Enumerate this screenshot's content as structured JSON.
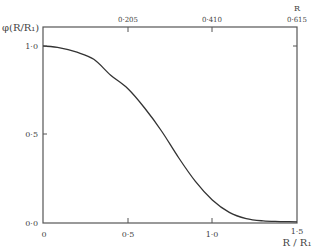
{
  "chart_data": {
    "type": "line",
    "title": "",
    "ylabel": "φ(R/R₁)",
    "xlabel": "R/R₁",
    "top_xlabel": "R",
    "xlim": [
      0,
      1.5
    ],
    "ylim": [
      0,
      1.0
    ],
    "x_ticks": [
      {
        "value": 0,
        "label": "0"
      },
      {
        "value": 0.5,
        "label": "0·5"
      },
      {
        "value": 1.0,
        "label": "1·0"
      },
      {
        "value": 1.5,
        "label": "1·5"
      }
    ],
    "top_x_ticks": [
      {
        "value": 0.5,
        "label": "0·205"
      },
      {
        "value": 1.0,
        "label": "0·410"
      },
      {
        "value": 1.5,
        "label": "0·615"
      }
    ],
    "y_ticks": [
      {
        "value": 0.0,
        "label": "0·0"
      },
      {
        "value": 0.5,
        "label": "0·5"
      },
      {
        "value": 1.0,
        "label": "1·0"
      }
    ],
    "grid": false,
    "legend": null,
    "series": [
      {
        "name": "φ(R/R₁)",
        "x": [
          0,
          0.1,
          0.2,
          0.3,
          0.4,
          0.5,
          0.6,
          0.7,
          0.8,
          0.9,
          1.0,
          1.1,
          1.2,
          1.3,
          1.4,
          1.5
        ],
        "y": [
          1.0,
          0.99,
          0.965,
          0.925,
          0.835,
          0.76,
          0.65,
          0.52,
          0.37,
          0.235,
          0.13,
          0.06,
          0.025,
          0.012,
          0.008,
          0.007
        ]
      }
    ]
  },
  "labels": {
    "y_axis": "φ(R/R₁)",
    "x_axis_bottom": "R / R₁",
    "x_axis_top": "R",
    "y_tick_0": "0·0",
    "y_tick_05": "0·5",
    "y_tick_1": "1·0",
    "x_tick_0": "0",
    "x_tick_05": "0·5",
    "x_tick_1": "1·0",
    "x_tick_15": "1·5",
    "top_tick_1": "0·205",
    "top_tick_2": "0·410",
    "top_tick_3": "0·615"
  }
}
